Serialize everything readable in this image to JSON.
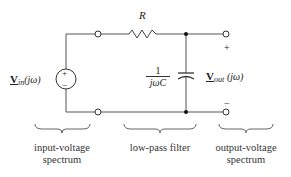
{
  "diagram": {
    "type": "circuit",
    "components": {
      "resistor": {
        "label": "R"
      },
      "capacitor": {
        "impedance_num": "1",
        "impedance_den": "jωC"
      },
      "source": {
        "symbol": "V",
        "subscript": "in",
        "arg": "(jω)",
        "plus": "+",
        "minus": "−"
      },
      "output": {
        "symbol": "V",
        "subscript": "out",
        "arg": "(jω)",
        "plus": "+",
        "minus": "−"
      }
    },
    "captions": [
      {
        "line1": "input-voltage",
        "line2": "spectrum"
      },
      {
        "line1": "low-pass filter",
        "line2": ""
      },
      {
        "line1": "output-voltage",
        "line2": "spectrum"
      }
    ],
    "colors": {
      "wire": "#555555",
      "text": "#222222",
      "background": "#ffffff"
    }
  }
}
